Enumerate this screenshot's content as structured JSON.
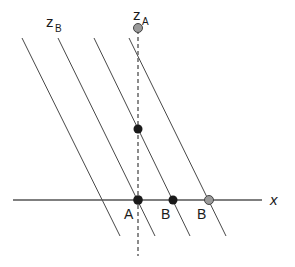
{
  "diagram": {
    "axes": {
      "x_label": "x",
      "z_a_label": {
        "main": "z",
        "sub": "A"
      },
      "z_b_label": {
        "main": "z",
        "sub": "B"
      }
    },
    "point_labels": [
      "A",
      "B",
      "B"
    ],
    "points": [
      {
        "id": "za-top",
        "fill": "gray"
      },
      {
        "id": "za-mid",
        "fill": "black"
      },
      {
        "id": "origin-A",
        "fill": "black"
      },
      {
        "id": "x-B1",
        "fill": "black"
      },
      {
        "id": "x-B2",
        "fill": "gray"
      }
    ],
    "oblique_line_count": 4,
    "colors": {
      "line": "#333333",
      "axis": "#555555",
      "dot_black": "#1a1a1a",
      "dot_gray": "#9a9a9a"
    }
  }
}
